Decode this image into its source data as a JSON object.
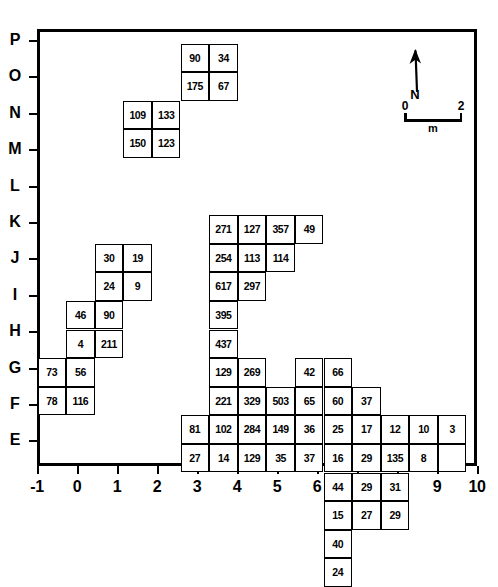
{
  "figure": {
    "type": "grid-distribution-plan"
  },
  "axes": {
    "x": {
      "label": "",
      "ticks": [
        "-1",
        "0",
        "1",
        "2",
        "3",
        "4",
        "5",
        "6",
        "7",
        "8",
        "9",
        "10"
      ],
      "range": [
        -1,
        10
      ]
    },
    "y": {
      "label": "",
      "ticks": [
        "P",
        "O",
        "N",
        "M",
        "L",
        "K",
        "J",
        "I",
        "H",
        "G",
        "F",
        "E"
      ],
      "range": [
        "E",
        "P"
      ]
    }
  },
  "north_arrow": {
    "label": "N",
    "icon": "north-arrow-icon"
  },
  "scale_bar": {
    "start_label": "0",
    "end_label": "2",
    "unit": "m"
  },
  "chart_data": {
    "type": "heatmap",
    "title": "",
    "xlabel": "",
    "ylabel": "",
    "xlim": [
      -1,
      10
    ],
    "ylim": [
      "E",
      "P"
    ],
    "grid": false,
    "legend": "none",
    "note": "Each labelled square is one excavation grid unit; the number is the count recorded in that unit.",
    "cells": [
      {
        "value": "90",
        "col": 6,
        "row": 1
      },
      {
        "value": "34",
        "col": 7,
        "row": 1
      },
      {
        "value": "175",
        "col": 6,
        "row": 2
      },
      {
        "value": "67",
        "col": 7,
        "row": 2
      },
      {
        "value": "109",
        "col": 4,
        "row": 3
      },
      {
        "value": "133",
        "col": 5,
        "row": 3
      },
      {
        "value": "150",
        "col": 4,
        "row": 4
      },
      {
        "value": "123",
        "col": 5,
        "row": 4
      },
      {
        "value": "271",
        "col": 7,
        "row": 7
      },
      {
        "value": "127",
        "col": 8,
        "row": 7
      },
      {
        "value": "357",
        "col": 9,
        "row": 7
      },
      {
        "value": "49",
        "col": 10,
        "row": 7
      },
      {
        "value": "254",
        "col": 7,
        "row": 8
      },
      {
        "value": "113",
        "col": 8,
        "row": 8
      },
      {
        "value": "114",
        "col": 9,
        "row": 8
      },
      {
        "value": "617",
        "col": 7,
        "row": 9
      },
      {
        "value": "297",
        "col": 8,
        "row": 9
      },
      {
        "value": "395",
        "col": 7,
        "row": 10
      },
      {
        "value": "30",
        "col": 3,
        "row": 8
      },
      {
        "value": "19",
        "col": 4,
        "row": 8
      },
      {
        "value": "24",
        "col": 3,
        "row": 9
      },
      {
        "value": "9",
        "col": 4,
        "row": 9
      },
      {
        "value": "46",
        "col": 2,
        "row": 10
      },
      {
        "value": "90",
        "col": 3,
        "row": 10
      },
      {
        "value": "4",
        "col": 2,
        "row": 11
      },
      {
        "value": "211",
        "col": 3,
        "row": 11
      },
      {
        "value": "73",
        "col": 1,
        "row": 12
      },
      {
        "value": "56",
        "col": 2,
        "row": 12
      },
      {
        "value": "78",
        "col": 1,
        "row": 13
      },
      {
        "value": "116",
        "col": 2,
        "row": 13
      },
      {
        "value": "437",
        "col": 7,
        "row": 11
      },
      {
        "value": "129",
        "col": 7,
        "row": 12
      },
      {
        "value": "269",
        "col": 8,
        "row": 12
      },
      {
        "value": "42",
        "col": 10,
        "row": 12
      },
      {
        "value": "66",
        "col": 11,
        "row": 12
      },
      {
        "value": "221",
        "col": 7,
        "row": 13
      },
      {
        "value": "329",
        "col": 8,
        "row": 13
      },
      {
        "value": "503",
        "col": 9,
        "row": 13
      },
      {
        "value": "65",
        "col": 10,
        "row": 13
      },
      {
        "value": "60",
        "col": 11,
        "row": 13
      },
      {
        "value": "37",
        "col": 12,
        "row": 13
      },
      {
        "value": "81",
        "col": 6,
        "row": 14
      },
      {
        "value": "102",
        "col": 7,
        "row": 14
      },
      {
        "value": "284",
        "col": 8,
        "row": 14
      },
      {
        "value": "149",
        "col": 9,
        "row": 14
      },
      {
        "value": "36",
        "col": 10,
        "row": 14
      },
      {
        "value": "25",
        "col": 11,
        "row": 14
      },
      {
        "value": "17",
        "col": 12,
        "row": 14
      },
      {
        "value": "12",
        "col": 13,
        "row": 14
      },
      {
        "value": "10",
        "col": 14,
        "row": 14
      },
      {
        "value": "3",
        "col": 15,
        "row": 14
      },
      {
        "value": "27",
        "col": 6,
        "row": 15
      },
      {
        "value": "14",
        "col": 7,
        "row": 15
      },
      {
        "value": "129",
        "col": 8,
        "row": 15
      },
      {
        "value": "35",
        "col": 9,
        "row": 15
      },
      {
        "value": "37",
        "col": 10,
        "row": 15
      },
      {
        "value": "16",
        "col": 11,
        "row": 15
      },
      {
        "value": "29",
        "col": 12,
        "row": 15
      },
      {
        "value": "135",
        "col": 13,
        "row": 15
      },
      {
        "value": "8",
        "col": 14,
        "row": 15
      },
      {
        "value": "",
        "col": 15,
        "row": 15
      },
      {
        "value": "44",
        "col": 11,
        "row": 16
      },
      {
        "value": "29",
        "col": 12,
        "row": 16
      },
      {
        "value": "31",
        "col": 13,
        "row": 16
      },
      {
        "value": "15",
        "col": 11,
        "row": 17
      },
      {
        "value": "27",
        "col": 12,
        "row": 17
      },
      {
        "value": "29",
        "col": 13,
        "row": 17
      },
      {
        "value": "40",
        "col": 11,
        "row": 18
      },
      {
        "value": "24",
        "col": 11,
        "row": 19
      }
    ]
  },
  "colors": {
    "ink": "#000000",
    "paper": "#ffffff"
  }
}
